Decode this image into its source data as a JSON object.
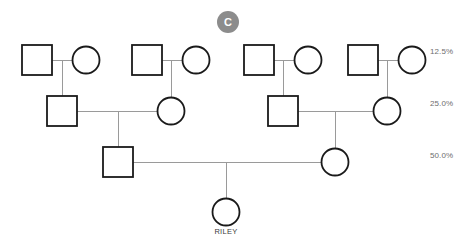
{
  "diagram": {
    "type": "pedigree-chart",
    "background_color": "#ffffff",
    "symbol_color": "#1a1a1a",
    "line_color": "#9a9a9a",
    "badge": {
      "label": "C",
      "background_color": "#8c8c8c",
      "text_color": "#ffffff",
      "x": 217,
      "y": 11,
      "size": 22
    },
    "relatedness_labels": [
      {
        "text": "12.5%",
        "x": 430,
        "y": 52,
        "color": "#6e6e6e"
      },
      {
        "text": "25.0%",
        "x": 430,
        "y": 104,
        "color": "#6e6e6e"
      },
      {
        "text": "50.0%",
        "x": 430,
        "y": 156,
        "color": "#6e6e6e"
      }
    ],
    "generations": [
      {
        "name": "generation-1",
        "y": 60,
        "people": [
          {
            "id": "g1-m1",
            "shape": "square",
            "sex": "male",
            "cx": 37,
            "cy": 60,
            "size": 30
          },
          {
            "id": "g1-f1",
            "shape": "circle",
            "sex": "female",
            "cx": 86,
            "cy": 60,
            "size": 27
          },
          {
            "id": "g1-m2",
            "shape": "square",
            "sex": "male",
            "cx": 147,
            "cy": 60,
            "size": 30
          },
          {
            "id": "g1-f2",
            "shape": "circle",
            "sex": "female",
            "cx": 196,
            "cy": 60,
            "size": 27
          },
          {
            "id": "g1-m3",
            "shape": "square",
            "sex": "male",
            "cx": 259,
            "cy": 60,
            "size": 30
          },
          {
            "id": "g1-f3",
            "shape": "circle",
            "sex": "female",
            "cx": 308,
            "cy": 60,
            "size": 27
          },
          {
            "id": "g1-m4",
            "shape": "square",
            "sex": "male",
            "cx": 363,
            "cy": 60,
            "size": 30
          },
          {
            "id": "g1-f4",
            "shape": "circle",
            "sex": "female",
            "cx": 412,
            "cy": 60,
            "size": 27
          }
        ]
      },
      {
        "name": "generation-2",
        "y": 111,
        "people": [
          {
            "id": "g2-m1",
            "shape": "square",
            "sex": "male",
            "cx": 62,
            "cy": 111,
            "size": 30
          },
          {
            "id": "g2-f1",
            "shape": "circle",
            "sex": "female",
            "cx": 171,
            "cy": 111,
            "size": 27
          },
          {
            "id": "g2-m2",
            "shape": "square",
            "sex": "male",
            "cx": 283,
            "cy": 111,
            "size": 30
          },
          {
            "id": "g2-f2",
            "shape": "circle",
            "sex": "female",
            "cx": 387,
            "cy": 111,
            "size": 27
          }
        ]
      },
      {
        "name": "generation-3",
        "y": 162,
        "people": [
          {
            "id": "g3-m1",
            "shape": "square",
            "sex": "male",
            "cx": 118,
            "cy": 162,
            "size": 30
          },
          {
            "id": "g3-f1",
            "shape": "circle",
            "sex": "female",
            "cx": 335,
            "cy": 162,
            "size": 27
          }
        ]
      },
      {
        "name": "generation-4",
        "y": 212,
        "people": [
          {
            "id": "g4-f1",
            "shape": "circle",
            "sex": "female",
            "cx": 226,
            "cy": 212,
            "size": 27,
            "label": "RILEY"
          }
        ]
      }
    ],
    "person_labels": [
      {
        "text": "RILEY",
        "x": 226,
        "y": 232
      }
    ],
    "mating_lines": [
      {
        "from": "g1-m1",
        "to": "g1-f1",
        "y": 60,
        "x1": 52,
        "x2": 72,
        "child_x": 62
      },
      {
        "from": "g1-m2",
        "to": "g1-f2",
        "y": 60,
        "x1": 162,
        "x2": 182,
        "child_x": 171
      },
      {
        "from": "g1-m3",
        "to": "g1-f3",
        "y": 60,
        "x1": 274,
        "x2": 294,
        "child_x": 283
      },
      {
        "from": "g1-m4",
        "to": "g1-f4",
        "y": 60,
        "x1": 378,
        "x2": 398,
        "child_x": 387
      },
      {
        "from": "g2-m1",
        "to": "g2-f1",
        "y": 111,
        "x1": 77,
        "x2": 157,
        "child_x": 118
      },
      {
        "from": "g2-m2",
        "to": "g2-f2",
        "y": 111,
        "x1": 298,
        "x2": 373,
        "child_x": 335
      },
      {
        "from": "g3-m1",
        "to": "g3-f1",
        "y": 162,
        "x1": 133,
        "x2": 321,
        "child_x": 226
      }
    ],
    "descent_lines": [
      {
        "from_couple": "g1-c1",
        "x": 62,
        "y1": 60,
        "y2": 96
      },
      {
        "from_couple": "g1-c2",
        "x": 171,
        "y1": 60,
        "y2": 97
      },
      {
        "from_couple": "g1-c3",
        "x": 283,
        "y1": 60,
        "y2": 96
      },
      {
        "from_couple": "g1-c4",
        "x": 387,
        "y1": 60,
        "y2": 97
      },
      {
        "from_couple": "g2-c1",
        "x": 118,
        "y1": 111,
        "y2": 147
      },
      {
        "from_couple": "g2-c2",
        "x": 335,
        "y1": 111,
        "y2": 148
      },
      {
        "from_couple": "g3-c1",
        "x": 226,
        "y1": 162,
        "y2": 198
      }
    ]
  }
}
